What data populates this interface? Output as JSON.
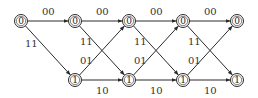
{
  "diagram": {
    "type": "trellis",
    "stroke_color": "#2a2a2a",
    "states": [
      "0",
      "1"
    ],
    "stage_x": [
      21,
      75,
      129,
      183,
      237
    ],
    "row_y": {
      "0": 21,
      "1": 80
    },
    "nodes": [
      {
        "id": "s0-0",
        "stage": 0,
        "state": "0",
        "label": "0"
      },
      {
        "id": "s1-0",
        "stage": 1,
        "state": "0",
        "label": "0"
      },
      {
        "id": "s1-1",
        "stage": 1,
        "state": "1",
        "label": "1"
      },
      {
        "id": "s2-0",
        "stage": 2,
        "state": "0",
        "label": "0"
      },
      {
        "id": "s2-1",
        "stage": 2,
        "state": "1",
        "label": "1"
      },
      {
        "id": "s3-0",
        "stage": 3,
        "state": "0",
        "label": "0"
      },
      {
        "id": "s3-1",
        "stage": 3,
        "state": "1",
        "label": "1"
      },
      {
        "id": "s4-0",
        "stage": 4,
        "state": "0",
        "label": "0"
      },
      {
        "id": "s4-1",
        "stage": 4,
        "state": "1",
        "label": "1"
      }
    ],
    "edges": [
      {
        "from": "s0-0",
        "to": "s1-0",
        "label": "00"
      },
      {
        "from": "s0-0",
        "to": "s1-1",
        "label": "11"
      },
      {
        "from": "s1-0",
        "to": "s2-0",
        "label": "00"
      },
      {
        "from": "s1-0",
        "to": "s2-1",
        "label": "11"
      },
      {
        "from": "s1-1",
        "to": "s2-0",
        "label": "01"
      },
      {
        "from": "s1-1",
        "to": "s2-1",
        "label": "10"
      },
      {
        "from": "s2-0",
        "to": "s3-0",
        "label": "00"
      },
      {
        "from": "s2-0",
        "to": "s3-1",
        "label": "11"
      },
      {
        "from": "s2-1",
        "to": "s3-0",
        "label": "01"
      },
      {
        "from": "s2-1",
        "to": "s3-1",
        "label": "10"
      },
      {
        "from": "s3-0",
        "to": "s4-0",
        "label": "00"
      },
      {
        "from": "s3-0",
        "to": "s4-1",
        "label": "11"
      },
      {
        "from": "s3-1",
        "to": "s4-0",
        "label": "01"
      },
      {
        "from": "s3-1",
        "to": "s4-1",
        "label": "10"
      }
    ],
    "labels": {
      "e0_00": "00",
      "e0_11": "11",
      "e1_00": "00",
      "e1_11": "11",
      "e1_01": "01",
      "e1_10": "10",
      "e2_00": "00",
      "e2_11": "11",
      "e2_01": "01",
      "e2_10": "10",
      "e3_00": "00",
      "e3_11": "11",
      "e3_01": "01",
      "e3_10": "10"
    }
  }
}
